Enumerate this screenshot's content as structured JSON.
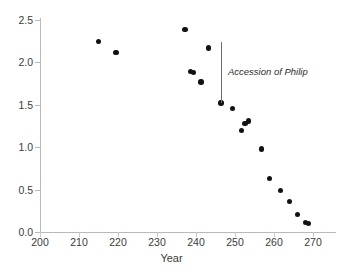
{
  "chart_data": {
    "type": "scatter",
    "title": "",
    "xlabel": "Year",
    "ylabel": "",
    "xlim": [
      200,
      272
    ],
    "ylim": [
      0.0,
      2.5
    ],
    "xticks": [
      200,
      210,
      220,
      230,
      240,
      250,
      260,
      270
    ],
    "yticks": [
      "0.0",
      "0.5",
      "1.0",
      "1.5",
      "2.0",
      "2.5"
    ],
    "ytick_values": [
      0.0,
      0.5,
      1.0,
      1.5,
      2.0,
      2.5
    ],
    "grid": false,
    "legend": null,
    "marker_color": "#121212",
    "axis_color": "#b9b9b9",
    "points": [
      {
        "x": 215.0,
        "y": 2.25
      },
      {
        "x": 219.5,
        "y": 2.12
      },
      {
        "x": 237.2,
        "y": 2.39
      },
      {
        "x": 238.6,
        "y": 1.89
      },
      {
        "x": 239.4,
        "y": 1.88
      },
      {
        "x": 241.3,
        "y": 1.77
      },
      {
        "x": 243.2,
        "y": 2.17
      },
      {
        "x": 246.4,
        "y": 1.52
      },
      {
        "x": 249.3,
        "y": 1.46
      },
      {
        "x": 251.7,
        "y": 1.2
      },
      {
        "x": 252.6,
        "y": 1.28
      },
      {
        "x": 253.4,
        "y": 1.31
      },
      {
        "x": 256.8,
        "y": 0.98
      },
      {
        "x": 258.8,
        "y": 0.63
      },
      {
        "x": 261.6,
        "y": 0.49
      },
      {
        "x": 263.9,
        "y": 0.36
      },
      {
        "x": 266.0,
        "y": 0.21
      },
      {
        "x": 268.0,
        "y": 0.11
      },
      {
        "x": 268.9,
        "y": 0.1
      }
    ],
    "annotations": [
      {
        "text": "Accession of Philip",
        "marker_x": 246.4,
        "line_top_y": 2.24,
        "line_bottom_y": 1.52,
        "text_x": 248.2,
        "text_y": 1.9
      }
    ]
  }
}
